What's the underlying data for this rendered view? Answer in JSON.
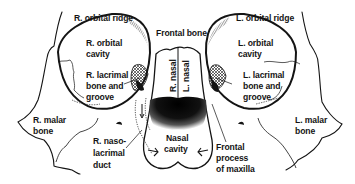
{
  "diagram": {
    "type": "anatomical",
    "labels": {
      "r_orbital_ridge": "R. orbital ridge",
      "frontal_bone": "Frontal bone",
      "l_orbital_ridge": "L. orbital ridge",
      "r_orbital_cavity_1": "R. orbital",
      "r_orbital_cavity_2": "cavity",
      "l_orbital_cavity_1": "L. orbital",
      "l_orbital_cavity_2": "cavity",
      "r_lacrimal_1": "R. lacrimal",
      "r_lacrimal_2": "bone and",
      "r_lacrimal_3": "groove",
      "l_lacrimal_1": "L. lacrimal",
      "l_lacrimal_2": "bone and",
      "l_lacrimal_3": "groove",
      "r_nasal": "R. nasal",
      "l_nasal": "L. nasal",
      "r_malar_1": "R. malar",
      "r_malar_2": "bone",
      "l_malar_1": "L. malar",
      "l_malar_2": "bone",
      "nasal_cavity_1": "Nasal",
      "nasal_cavity_2": "cavity",
      "r_nasolacrimal_1": "R. naso-",
      "r_nasolacrimal_2": "lacrimal",
      "r_nasolacrimal_3": "duct",
      "frontal_process_1": "Frontal",
      "frontal_process_2": "process",
      "frontal_process_3": "of maxilla"
    },
    "colors": {
      "ink": "#141414",
      "background": "#ffffff"
    }
  }
}
